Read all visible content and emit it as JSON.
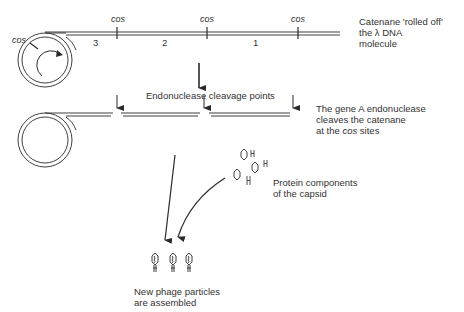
{
  "step1": {
    "cos_labels": [
      "cos",
      "cos",
      "cos",
      "cos"
    ],
    "segment_numbers": [
      "3",
      "2",
      "1"
    ],
    "caption_line1": "Catenane 'rolled off'",
    "caption_line2": "the λ DNA",
    "caption_line3": "molecule"
  },
  "step2": {
    "arrow_label": "Endonuclease cleavage points",
    "caption_line1": "The gene A endonuclease",
    "caption_line2": "cleaves the catenane",
    "caption_line3_prefix": "at the ",
    "caption_line3_italic": "cos",
    "caption_line3_suffix": " sites"
  },
  "step3": {
    "protein_caption_line1": "Protein components",
    "protein_caption_line2": "of the capsid",
    "phage_caption_line1": "New phage particles",
    "phage_caption_line2": "are assembled"
  },
  "colors": {
    "line": "#2a2a2a",
    "text": "#333333"
  }
}
